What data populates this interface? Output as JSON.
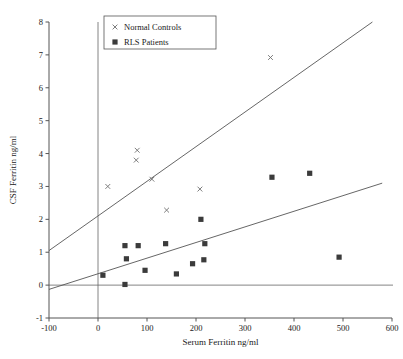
{
  "chart_data": {
    "type": "scatter",
    "title": "",
    "xlabel": "Serum Ferritin ng/ml",
    "ylabel": "CSF Ferritin ng/ml",
    "xlim": [
      -100,
      600
    ],
    "ylim": [
      -1,
      8
    ],
    "xticks": [
      -100,
      0,
      100,
      200,
      300,
      400,
      500,
      600
    ],
    "yticks": [
      -1,
      0,
      1,
      2,
      3,
      4,
      5,
      6,
      7,
      8
    ],
    "xticklabels": [
      "-100",
      "0",
      "100",
      "200",
      "300",
      "400",
      "500",
      "600"
    ],
    "yticklabels": [
      "-1",
      "0",
      "1",
      "2",
      "3",
      "4",
      "5",
      "6",
      "7",
      "8"
    ],
    "grid": false,
    "legend_position": "top-left",
    "series": [
      {
        "name": "Normal Controls",
        "marker": "x",
        "color": "#6f6f6f",
        "points": [
          {
            "x": 20,
            "y": 3.0
          },
          {
            "x": 80,
            "y": 4.1
          },
          {
            "x": 78,
            "y": 3.8
          },
          {
            "x": 110,
            "y": 3.22
          },
          {
            "x": 140,
            "y": 2.28
          },
          {
            "x": 208,
            "y": 2.92
          },
          {
            "x": 352,
            "y": 6.92
          }
        ]
      },
      {
        "name": "RLS Patients",
        "marker": "square",
        "color": "#3b3b3b",
        "points": [
          {
            "x": 10,
            "y": 0.3
          },
          {
            "x": 55,
            "y": 0.02
          },
          {
            "x": 55,
            "y": 1.2
          },
          {
            "x": 58,
            "y": 0.8
          },
          {
            "x": 82,
            "y": 1.2
          },
          {
            "x": 96,
            "y": 0.45
          },
          {
            "x": 138,
            "y": 1.26
          },
          {
            "x": 160,
            "y": 0.34
          },
          {
            "x": 193,
            "y": 0.65
          },
          {
            "x": 216,
            "y": 0.77
          },
          {
            "x": 218,
            "y": 1.26
          },
          {
            "x": 210,
            "y": 2.0
          },
          {
            "x": 355,
            "y": 3.28
          },
          {
            "x": 432,
            "y": 3.4
          },
          {
            "x": 492,
            "y": 0.85
          }
        ]
      }
    ],
    "fit_lines": [
      {
        "name": "normal-controls-fit",
        "x1": -100,
        "y1": 1.05,
        "x2": 560,
        "y2": 8.0
      },
      {
        "name": "rls-patients-fit",
        "x1": -100,
        "y1": -0.13,
        "x2": 580,
        "y2": 3.1
      }
    ],
    "reference_lines": [
      {
        "name": "y-zero-line",
        "orientation": "horizontal",
        "value": 0
      },
      {
        "name": "x-zero-line",
        "orientation": "vertical",
        "value": 0
      }
    ]
  },
  "legend": {
    "entries": [
      {
        "label": "Normal Controls",
        "marker": "x"
      },
      {
        "label": "RLS Patients",
        "marker": "square"
      }
    ]
  }
}
